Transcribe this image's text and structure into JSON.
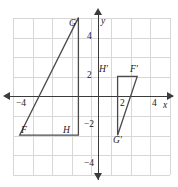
{
  "figure": {
    "axis_labels": {
      "x": "x",
      "y": "y"
    },
    "x_ticks": [
      {
        "label": "−4",
        "value": -4
      },
      {
        "label": "2",
        "value": 2
      },
      {
        "label": "4",
        "value": 4
      }
    ],
    "y_ticks": [
      {
        "label": "4",
        "value": 4
      },
      {
        "label": "2",
        "value": 2
      },
      {
        "label": "−2",
        "value": -2
      },
      {
        "label": "−4",
        "value": -4
      }
    ],
    "grid": {
      "visible": true,
      "x_range": [
        -4,
        4
      ],
      "y_range": [
        -4,
        4
      ],
      "step": 1,
      "color": "#d7d7d7"
    },
    "axis_color": "#3b3b3b",
    "shape_color": "#4a4a4a",
    "shapes": [
      {
        "name": "triangle-FGH",
        "vertices": [
          {
            "label": "F",
            "x": -4,
            "y": -2
          },
          {
            "label": "G",
            "x": -1,
            "y": 4
          },
          {
            "label": "H",
            "x": -1,
            "y": -2
          }
        ]
      },
      {
        "name": "triangle-F-prime-G-prime-H-prime",
        "vertices": [
          {
            "label": "H′",
            "x": 1,
            "y": 1
          },
          {
            "label": "F′",
            "x": 2,
            "y": 1
          },
          {
            "label": "G′",
            "x": 1,
            "y": -2
          }
        ]
      }
    ],
    "vertex_labels": {
      "F": "F",
      "G": "G",
      "H": "H",
      "Fp": "F′",
      "Gp": "G′",
      "Hp": "H′"
    }
  }
}
